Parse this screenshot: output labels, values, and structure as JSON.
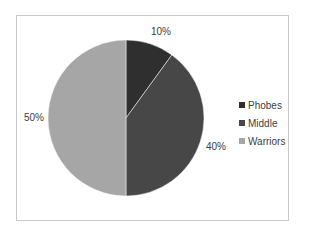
{
  "chart_data": {
    "type": "pie",
    "title": "",
    "categories": [
      "Phobes",
      "Middle",
      "Warriors"
    ],
    "values": [
      10,
      40,
      50
    ],
    "labels": [
      "10%",
      "40%",
      "50%"
    ],
    "colors": [
      "#2f2f2f",
      "#474747",
      "#a6a6a6"
    ],
    "start_angle_deg": 0,
    "direction": "clockwise",
    "legend_position": "right"
  },
  "legend": {
    "items": [
      {
        "label": "Phobes",
        "color": "#2f2f2f"
      },
      {
        "label": "Middle",
        "color": "#474747"
      },
      {
        "label": "Warriors",
        "color": "#a6a6a6"
      }
    ]
  },
  "data_labels": {
    "phobes": "10%",
    "middle": "40%",
    "warriors": "50%"
  }
}
